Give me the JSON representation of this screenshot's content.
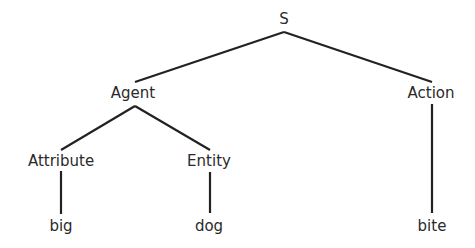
{
  "diagram": {
    "type": "tree",
    "colors": {
      "line": "#222222",
      "text": "#2a2a2a",
      "background": "#ffffff"
    },
    "nodes": {
      "S": {
        "label": "S",
        "x": 284,
        "y": 19
      },
      "Agent": {
        "label": "Agent",
        "x": 133,
        "y": 93
      },
      "Action": {
        "label": "Action",
        "x": 431,
        "y": 93
      },
      "Attribute": {
        "label": "Attribute",
        "x": 61,
        "y": 161
      },
      "Entity": {
        "label": "Entity",
        "x": 209,
        "y": 161
      },
      "big": {
        "label": "big",
        "x": 61,
        "y": 226
      },
      "dog": {
        "label": "dog",
        "x": 209,
        "y": 226
      },
      "bite": {
        "label": "bite",
        "x": 432,
        "y": 226
      }
    },
    "edges": [
      {
        "from": "S",
        "to": "Agent",
        "x1": 284,
        "y1": 32,
        "x2": 135,
        "y2": 82
      },
      {
        "from": "S",
        "to": "Action",
        "x1": 284,
        "y1": 32,
        "x2": 432,
        "y2": 82
      },
      {
        "from": "Agent",
        "to": "Attribute",
        "x1": 135,
        "y1": 106,
        "x2": 61,
        "y2": 150
      },
      {
        "from": "Agent",
        "to": "Entity",
        "x1": 135,
        "y1": 106,
        "x2": 210,
        "y2": 150
      },
      {
        "from": "Attribute",
        "to": "big",
        "x1": 61,
        "y1": 171,
        "x2": 61,
        "y2": 214
      },
      {
        "from": "Entity",
        "to": "dog",
        "x1": 210,
        "y1": 172,
        "x2": 210,
        "y2": 213
      },
      {
        "from": "Action",
        "to": "bite",
        "x1": 432,
        "y1": 104,
        "x2": 432,
        "y2": 213
      }
    ]
  }
}
